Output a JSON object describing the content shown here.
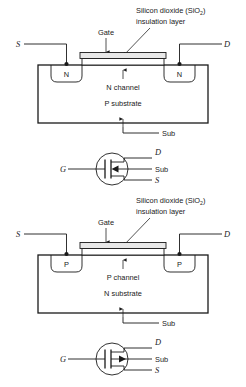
{
  "figure": {
    "colors": {
      "ink": "#1a1a1a",
      "background": "#ffffff",
      "gate_fill": "#e8e8e8"
    },
    "panels": [
      {
        "id": "n-channel-cross-section",
        "type": "cross-section",
        "callouts": {
          "oxide_line1": "Silicon dioxide (SiO",
          "oxide_sub": "2",
          "oxide_line1_close": ")",
          "oxide_line2": "insulation layer",
          "gate": "Gate"
        },
        "terminals": {
          "source": "S",
          "drain": "D",
          "substrate": "Sub"
        },
        "regions": {
          "source_well": "N",
          "drain_well": "N",
          "channel": "N channel",
          "substrate_body": "P substrate"
        }
      },
      {
        "id": "n-channel-symbol",
        "type": "schematic-symbol",
        "terminals": {
          "gate": "G",
          "drain": "D",
          "substrate": "Sub",
          "source": "S"
        },
        "arrow_direction": "inward"
      },
      {
        "id": "p-channel-cross-section",
        "type": "cross-section",
        "callouts": {
          "oxide_line1": "Silicon dioxide (SiO",
          "oxide_sub": "2",
          "oxide_line1_close": ")",
          "oxide_line2": "insulation layer",
          "gate": "Gate"
        },
        "terminals": {
          "source": "S",
          "drain": "D",
          "substrate": "Sub"
        },
        "regions": {
          "source_well": "P",
          "drain_well": "P",
          "channel": "P channel",
          "substrate_body": "N substrate"
        }
      },
      {
        "id": "p-channel-symbol",
        "type": "schematic-symbol",
        "terminals": {
          "gate": "G",
          "drain": "D",
          "substrate": "Sub",
          "source": "S"
        },
        "arrow_direction": "outward"
      }
    ]
  }
}
